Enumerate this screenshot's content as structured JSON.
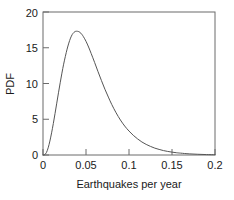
{
  "chart_data": {
    "type": "line",
    "title": "",
    "xlabel": "Earthquakes per year",
    "ylabel": "PDF",
    "xlim": [
      0,
      0.2
    ],
    "ylim": [
      0,
      20
    ],
    "grid": false,
    "legend": null,
    "xticks": [
      0,
      0.05,
      0.1,
      0.15,
      0.2
    ],
    "xticklabels": [
      "0",
      "0.05",
      "0.1",
      "0.15",
      "0.2"
    ],
    "yticks": [
      0,
      5,
      10,
      15,
      20
    ],
    "yticklabels": [
      "0",
      "5",
      "10",
      "15",
      "20"
    ],
    "peak": {
      "x": 0.041,
      "y": 17.3
    },
    "series": [
      {
        "name": "PDF of earthquakes per year",
        "x": [
          0.0,
          0.002,
          0.004,
          0.006,
          0.008,
          0.01,
          0.012,
          0.014,
          0.016,
          0.018,
          0.02,
          0.022,
          0.024,
          0.026,
          0.028,
          0.03,
          0.032,
          0.034,
          0.036,
          0.038,
          0.04,
          0.041,
          0.043,
          0.045,
          0.047,
          0.05,
          0.053,
          0.056,
          0.06,
          0.064,
          0.068,
          0.072,
          0.076,
          0.08,
          0.085,
          0.09,
          0.095,
          0.1,
          0.105,
          0.11,
          0.115,
          0.12,
          0.125,
          0.13,
          0.135,
          0.14,
          0.145,
          0.15,
          0.155,
          0.16,
          0.17,
          0.18,
          0.19,
          0.2
        ],
        "y": [
          0.0,
          0.05,
          0.35,
          1.0,
          1.95,
          3.1,
          4.4,
          5.8,
          7.25,
          8.7,
          10.1,
          11.45,
          12.7,
          13.8,
          14.8,
          15.65,
          16.35,
          16.85,
          17.15,
          17.3,
          17.3,
          17.28,
          17.15,
          16.9,
          16.55,
          15.9,
          15.1,
          14.2,
          12.95,
          11.65,
          10.4,
          9.2,
          8.1,
          7.05,
          5.9,
          4.9,
          4.05,
          3.35,
          2.75,
          2.25,
          1.82,
          1.48,
          1.2,
          0.96,
          0.78,
          0.62,
          0.5,
          0.4,
          0.32,
          0.26,
          0.16,
          0.1,
          0.06,
          0.04
        ]
      }
    ],
    "colors": {
      "curve": "#555555",
      "frame": "#6b6b6b",
      "text": "#1a1a1a",
      "background": "#ffffff"
    }
  }
}
